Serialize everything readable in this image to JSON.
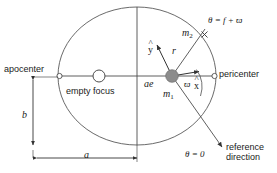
{
  "diagram": {
    "colors": {
      "stroke": "#4d4d4d",
      "axis": "#333333",
      "text": "#1a1a1a",
      "primary_fill": "#8c8c8c",
      "background": "#ffffff"
    },
    "labels": {
      "apocenter": "apocenter",
      "pericenter": "pericenter",
      "empty_focus": "empty focus",
      "reference_direction_line1": "reference",
      "reference_direction_line2": "direction",
      "semi_major": "a",
      "semi_minor": "b",
      "focal_distance": "ae",
      "radius": "r",
      "primary_mass": "m",
      "primary_mass_sub": "1",
      "secondary_mass": "m",
      "secondary_mass_sub": "2",
      "x_unit_vector": "x",
      "y_unit_vector": "y",
      "longitude_of_pericenter": "ϖ",
      "true_longitude": "θ = f + ϖ",
      "reference_angle": "θ = 0"
    },
    "geometry": {
      "ellipse_center_x": 137,
      "ellipse_center_y": 76,
      "semi_major_px": 79,
      "semi_minor_px": 69,
      "primary_focus_x": 172,
      "empty_focus_x": 99,
      "apocenter_x": 58,
      "pericenter_x": 216,
      "secondary_x": 204,
      "secondary_y": 34,
      "pericenter_angle_deg": 55
    }
  }
}
